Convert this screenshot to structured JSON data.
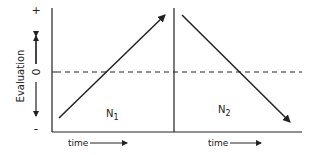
{
  "diagram": {
    "y_axis": {
      "label": "Evaluation",
      "top_symbol": "+",
      "zero_symbol": "0",
      "bottom_symbol": "-"
    },
    "panels": [
      {
        "label": "N",
        "subscript": "1",
        "trend": "increasing",
        "x_label": "time"
      },
      {
        "label": "N",
        "subscript": "2",
        "trend": "decreasing",
        "x_label": "time"
      }
    ],
    "reference_line": "dashed zero line",
    "colors": {
      "ink": "#222222",
      "background": "#ffffff"
    }
  }
}
